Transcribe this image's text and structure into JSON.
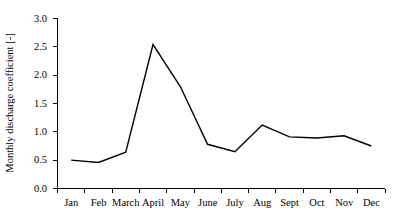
{
  "chart_data": {
    "type": "line",
    "title": "",
    "subtitle": "",
    "xlabel": "",
    "ylabel": "Monthly discharge coefficient [-]",
    "categories": [
      "Jan",
      "Feb",
      "March",
      "April",
      "May",
      "June",
      "July",
      "Aug",
      "Sept",
      "Oct",
      "Nov",
      "Dec"
    ],
    "values": [
      0.5,
      0.46,
      0.64,
      2.54,
      1.8,
      0.78,
      0.65,
      1.12,
      0.91,
      0.89,
      0.93,
      0.75
    ],
    "series": [
      {
        "name": "Monthly discharge coefficient",
        "values": [
          0.5,
          0.46,
          0.64,
          2.54,
          1.8,
          0.78,
          0.65,
          1.12,
          0.91,
          0.89,
          0.93,
          0.75
        ],
        "color": "#000000"
      }
    ],
    "ylim": [
      0.0,
      3.0
    ],
    "y_ticks": [
      0.0,
      0.5,
      1.0,
      1.5,
      2.0,
      2.5,
      3.0
    ],
    "y_tick_labels": [
      "0.0",
      "0.5",
      "1.0",
      "1.5",
      "2.0",
      "2.5",
      "3.0"
    ],
    "x_tick_labels": [
      "Jan",
      "Feb",
      "March",
      "April",
      "May",
      "June",
      "July",
      "Aug",
      "Sept",
      "Oct",
      "Nov",
      "Dec"
    ],
    "grid": false,
    "legend": false,
    "legend_position": "none",
    "annotations": []
  },
  "axes": {
    "y_title": "Monthly discharge coefficient [-]",
    "x_title": ""
  },
  "labels": {
    "y0": "0.0",
    "y1": "0.5",
    "y2": "1.0",
    "y3": "1.5",
    "y4": "2.0",
    "y5": "2.5",
    "y6": "3.0",
    "x0": "Jan",
    "x1": "Feb",
    "x2": "March",
    "x3": "April",
    "x4": "May",
    "x5": "June",
    "x6": "July",
    "x7": "Aug",
    "x8": "Sept",
    "x9": "Oct",
    "x10": "Nov",
    "x11": "Dec"
  },
  "style": {
    "line_color": "#000000",
    "axis_color": "#000000",
    "background": "#ffffff"
  }
}
